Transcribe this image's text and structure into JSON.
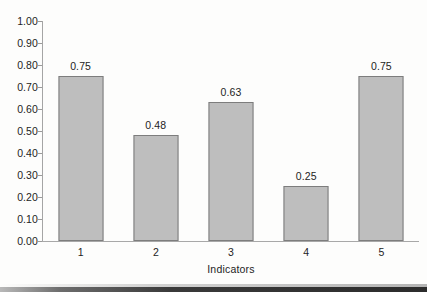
{
  "chart_data": {
    "type": "bar",
    "title": "",
    "xlabel": "Indicators",
    "ylabel": "",
    "categories": [
      "1",
      "2",
      "3",
      "4",
      "5"
    ],
    "values": [
      0.75,
      0.48,
      0.63,
      0.25,
      0.75
    ],
    "value_labels": [
      "0.75",
      "0.48",
      "0.63",
      "0.25",
      "0.75"
    ],
    "ylim": [
      0.0,
      1.0
    ],
    "ytick_labels": [
      "1.00",
      "0.90",
      "0.80",
      "0.70",
      "0.60",
      "0.50",
      "0.40",
      "0.30",
      "0.20",
      "0.10",
      "0.00"
    ],
    "ytick_values": [
      1.0,
      0.9,
      0.8,
      0.7,
      0.6,
      0.5,
      0.4,
      0.3,
      0.2,
      0.1,
      0.0
    ],
    "grid": false,
    "legend": null,
    "legend_position": "none",
    "series": [
      {
        "name": "",
        "values": [
          0.75,
          0.48,
          0.63,
          0.25,
          0.75
        ]
      }
    ],
    "colors": {
      "bar_fill": "#bebebe",
      "bar_border": "#7d7d7d",
      "axis": "#a5a5a5",
      "text": "#232323",
      "background": "#fdfdfc"
    }
  }
}
